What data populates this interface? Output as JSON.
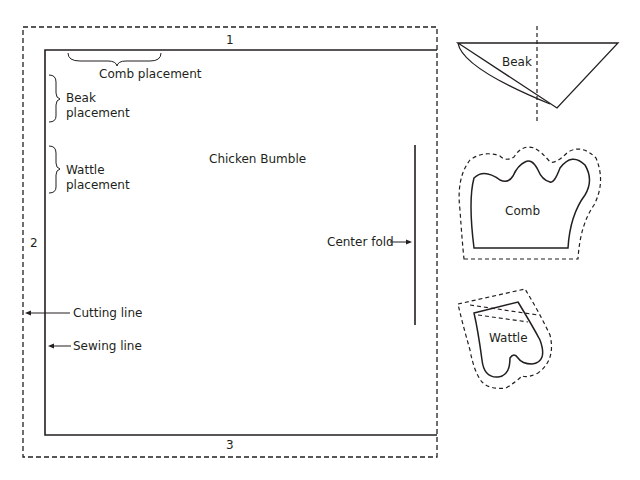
{
  "pattern": {
    "title": "Chicken Bumble",
    "edge_labels": {
      "top": "1",
      "left": "2",
      "bottom": "3"
    },
    "placements": {
      "comb": "Comb placement",
      "beak": [
        "Beak",
        "placement"
      ],
      "wattle": [
        "Wattle",
        "placement"
      ]
    },
    "center_fold": "Center fold",
    "legend": {
      "cutting_line": "Cutting line",
      "sewing_line": "Sewing line"
    }
  },
  "pieces": {
    "beak": "Beak",
    "comb": "Comb",
    "wattle": "Wattle"
  },
  "colors": {
    "line": "#231f20",
    "background": "#ffffff"
  }
}
